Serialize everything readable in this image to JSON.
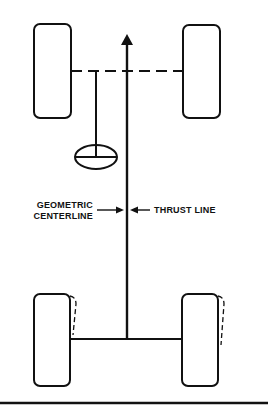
{
  "diagram": {
    "labels": {
      "geometric_line1": "GEOMETRIC",
      "geometric_line2": "CENTERLINE",
      "thrust": "THRUST LINE"
    },
    "components": [
      "front-left-wheel",
      "front-right-wheel",
      "rear-left-wheel",
      "rear-right-wheel",
      "front-axle-dashed",
      "rear-axle",
      "steering-wheel",
      "thrust-line-arrow"
    ],
    "colors": {
      "stroke": "#111111",
      "background": "#ffffff"
    }
  }
}
